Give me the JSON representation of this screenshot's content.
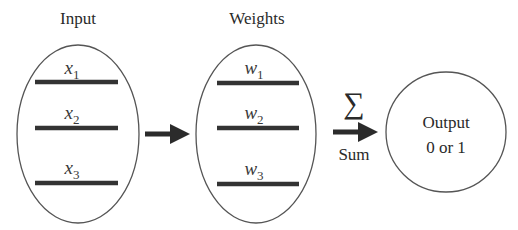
{
  "diagram": {
    "input_group": {
      "label": "Input",
      "items": [
        {
          "var": "x",
          "sub": "1"
        },
        {
          "var": "x",
          "sub": "2"
        },
        {
          "var": "x",
          "sub": "3"
        }
      ]
    },
    "weights_group": {
      "label": "Weights",
      "items": [
        {
          "var": "w",
          "sub": "1"
        },
        {
          "var": "w",
          "sub": "2"
        },
        {
          "var": "w",
          "sub": "3"
        }
      ]
    },
    "sum_arrow": {
      "symbol": "∑",
      "label": "Sum"
    },
    "output_node": {
      "line1": "Output",
      "line2": "0 or 1"
    },
    "colors": {
      "stroke": "#555555",
      "bar": "#333333",
      "arrow": "#2b2b2b",
      "text": "#2a2a2a"
    }
  }
}
